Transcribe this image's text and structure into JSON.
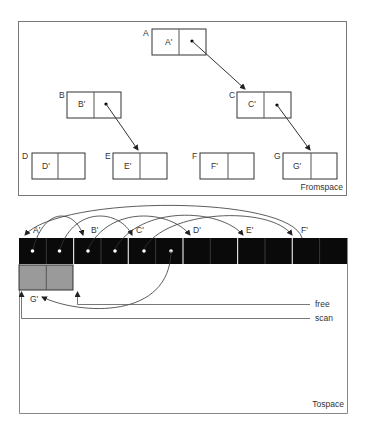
{
  "fromspace": {
    "label": "Fromspace",
    "nodes": [
      {
        "id": "A",
        "label": "A",
        "content": "A'"
      },
      {
        "id": "B",
        "label": "B",
        "content": "B'"
      },
      {
        "id": "C",
        "label": "C",
        "content": "C'"
      },
      {
        "id": "D",
        "label": "D",
        "content": "D'"
      },
      {
        "id": "E",
        "label": "E",
        "content": "E'"
      },
      {
        "id": "F",
        "label": "F",
        "content": "F'"
      },
      {
        "id": "G",
        "label": "G",
        "content": "G'"
      }
    ],
    "edges": [
      [
        "A",
        "C"
      ],
      [
        "B",
        "E"
      ],
      [
        "C",
        "G"
      ]
    ]
  },
  "tospace": {
    "label": "Tospace",
    "copied_labels": [
      "A'",
      "B'",
      "C'",
      "D'",
      "E'",
      "F'"
    ],
    "gray_label": "G'",
    "pointers": {
      "free": "free",
      "scan": "scan"
    }
  }
}
